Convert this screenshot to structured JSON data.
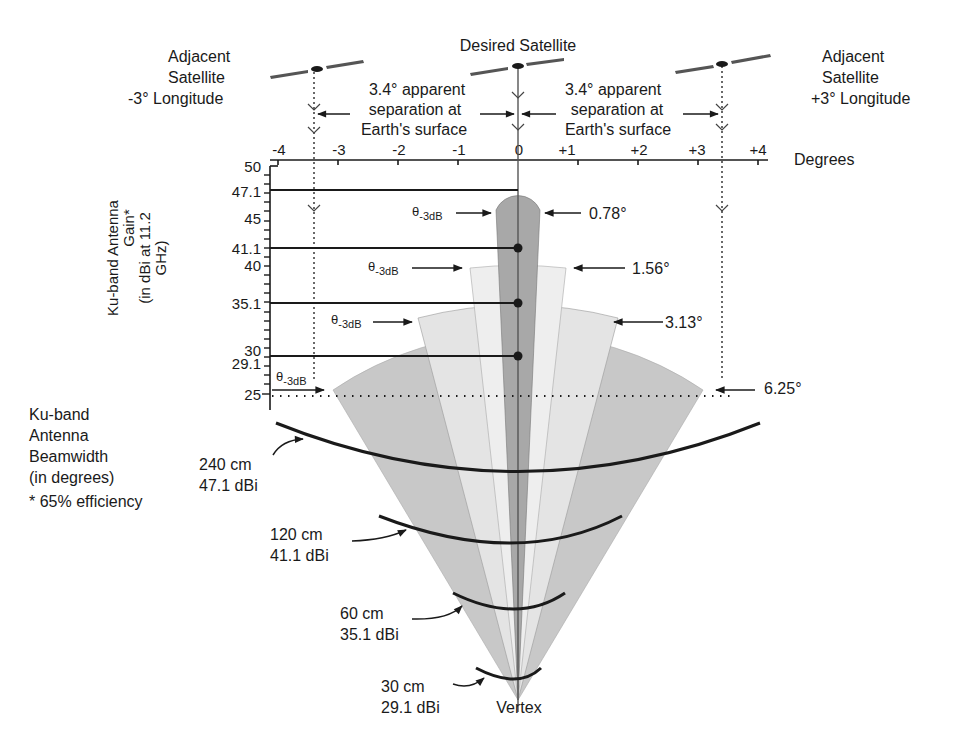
{
  "title": "Desired Satellite",
  "adjacent_left": {
    "line1": "Adjacent",
    "line2": "Satellite",
    "line3": "-3°  Longitude"
  },
  "adjacent_right": {
    "line1": "Adjacent",
    "line2": "Satellite",
    "line3": "+3°  Longitude"
  },
  "separation_left": {
    "line1": "3.4°  apparent",
    "line2": "separation at",
    "line3": "Earth's surface"
  },
  "separation_right": {
    "line1": "3.4°  apparent",
    "line2": "separation at",
    "line3": "Earth's surface"
  },
  "x_axis": {
    "label": "Degrees",
    "ticks": [
      "-4",
      "-3",
      "-2",
      "-1",
      "0",
      "+1",
      "+2",
      "+3",
      "+4"
    ]
  },
  "y_axis": {
    "label_line1": "Ku-band Antenna",
    "label_line2": "Gain*",
    "label_line3": "(in dBi at 11.2",
    "label_line4": "GHz)",
    "ticks": [
      "50",
      "47.1",
      "45",
      "41.1",
      "40",
      "35.1",
      "30",
      "29.1",
      "25"
    ]
  },
  "theta_label": "θ",
  "theta_sub": "-3dB",
  "beamwidths": [
    "0.78°",
    "1.56°",
    "3.13°",
    "6.25°"
  ],
  "beamwidth_legend": {
    "line1": "Ku-band",
    "line2": "Antenna",
    "line3": "Beamwidth",
    "line4": "(in degrees)",
    "footnote": "* 65% efficiency"
  },
  "antennas": [
    {
      "size": "240 cm",
      "gain": "47.1 dBi"
    },
    {
      "size": "120 cm",
      "gain": "41.1 dBi"
    },
    {
      "size": "60 cm",
      "gain": "35.1 dBi"
    },
    {
      "size": "30 cm",
      "gain": "29.1 dBi"
    }
  ],
  "vertex_label": "Vertex",
  "colors": {
    "beam_240": "#a8a8a8",
    "beam_120": "#ececec",
    "beam_60": "#e2e2e2",
    "beam_30": "#c8c8c8",
    "ink": "#1a1a1a"
  }
}
